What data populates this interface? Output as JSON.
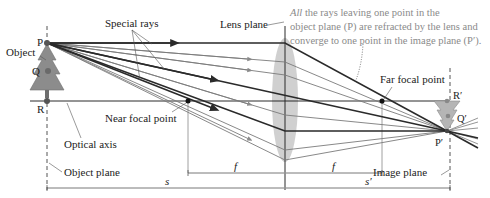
{
  "labels": {
    "special_rays": "Special rays",
    "lens_plane": "Lens plane",
    "note_line1_italic": "All",
    "note_line1_rest": " the rays leaving one point in the",
    "note_line2": "object plane (P) are refracted by the lens and",
    "note_line3": "converge to one point in the image plane (P′).",
    "far_focal_point": "Far focal point",
    "near_focal_point": "Near focal point",
    "optical_axis": "Optical axis",
    "object": "Object",
    "object_plane": "Object plane",
    "image_plane": "Image plane",
    "P": "P",
    "Q": "Q",
    "R": "R",
    "P_prime": "P′",
    "Q_prime": "Q′",
    "R_prime": "R′",
    "f_left": "f",
    "f_right": "f",
    "s": "s",
    "s_prime": "s′"
  },
  "colors": {
    "ray_dark": "#2a2a2a",
    "ray_light": "#7a7a7a",
    "lens_fill": "#c8c8c8",
    "tree_fill": "#8c8c8c",
    "image_tree_fill": "#b5b5b5",
    "note_text": "#8a8a8a",
    "dim_line": "#555555"
  }
}
